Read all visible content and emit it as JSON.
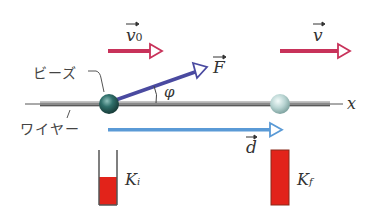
{
  "diagram": {
    "labels": {
      "bead": "ビーズ",
      "wire": "ワイヤー",
      "v0_main": "v",
      "v0_sub": "0",
      "v_main": "v",
      "force": "F",
      "phi": "φ",
      "x_axis": "x",
      "displacement": "d",
      "ki_main": "K",
      "ki_sub": "i",
      "kf_main": "K",
      "kf_sub": "f"
    },
    "colors": {
      "velocity_arrow": "#c8325a",
      "force_arrow": "#4a4aa0",
      "displacement_arrow": "#5a9ad6",
      "wire": "#7a7a7a",
      "bead_initial": "#2f6f6a",
      "bead_final": "#b8d4d2",
      "kinetic_bar": "#e2231a",
      "text": "#333333"
    },
    "energy_bars": {
      "initial_fill_fraction": 0.45,
      "final_fill_fraction": 1.0
    }
  }
}
